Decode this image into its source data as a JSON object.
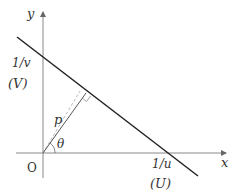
{
  "diagram": {
    "type": "geometry",
    "axes": {
      "x_label": "x",
      "y_label": "y",
      "origin_label": "O"
    },
    "intercepts": {
      "y_intercept_label": "1/v",
      "y_intercept_sublabel": "(V)",
      "x_intercept_label": "1/u",
      "x_intercept_sublabel": "(U)"
    },
    "perpendicular": {
      "length_label": "p",
      "angle_label": "θ"
    },
    "colors": {
      "axis": "#888888",
      "line": "#222222",
      "perpendicular": "#555555",
      "dashed": "#bbbbbb",
      "text": "#333333"
    }
  }
}
